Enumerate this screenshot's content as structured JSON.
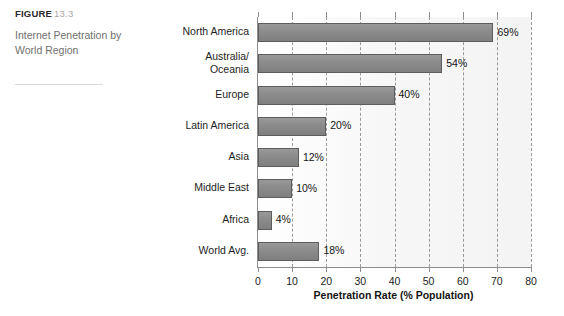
{
  "figure": {
    "label": "FIGURE",
    "number": "13.3",
    "caption": "Internet Penetration by World Region"
  },
  "chart_data": {
    "type": "bar",
    "orientation": "horizontal",
    "title": "Internet Penetration by World Region",
    "xlabel": "Penetration Rate (% Population)",
    "ylabel": "",
    "xlim": [
      0,
      80
    ],
    "xticks": [
      0,
      10,
      20,
      30,
      40,
      50,
      60,
      70,
      80
    ],
    "xtick_labels": [
      "0",
      "10",
      "20",
      "30",
      "40",
      "50",
      "60",
      "70",
      "80"
    ],
    "grid": "vertical-dashed",
    "legend": "none",
    "categories": [
      "North America",
      "Australia/\nOceania",
      "Europe",
      "Latin America",
      "Asia",
      "Middle East",
      "Africa",
      "World Avg."
    ],
    "values": [
      69,
      54,
      40,
      20,
      12,
      10,
      4,
      18
    ],
    "value_labels": [
      "69%",
      "54%",
      "40%",
      "20%",
      "12%",
      "10%",
      "4%",
      "18%"
    ],
    "colors": {
      "bar_fill": "#8c8c8c",
      "bar_border": "#5d5d5d",
      "plot_background": "#f6f6f6",
      "axis": "#8d8d8d",
      "gridline": "#9a9a9a",
      "text": "#1d1d1d",
      "caption_text": "#6f6f6f",
      "figure_number": "#a7a7a7"
    }
  }
}
